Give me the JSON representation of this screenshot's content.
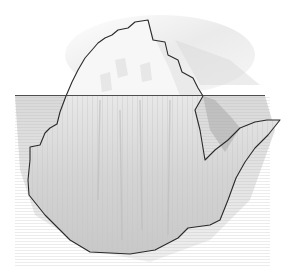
{
  "image": {
    "title": "Iceberg pencil sketch",
    "description": "Hand-drawn graphite illustration of an iceberg: a small jagged peak above a horizontal waterline and a much larger shaded mass below the surface.",
    "waterline_y": 95,
    "colors": {
      "background": "#ffffff",
      "outline": "#2a2a2a",
      "ice_above": "#f6f6f6",
      "ice_below": "#d6d6d6",
      "water_shade": "#bdbdbd",
      "sky_hatch": "#cfcfcf"
    }
  }
}
